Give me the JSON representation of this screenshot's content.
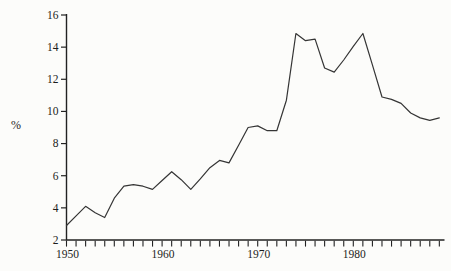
{
  "page": {
    "background": "#fcfcfa"
  },
  "chart_data": {
    "type": "line",
    "title": "",
    "xlabel": "",
    "ylabel": "%",
    "x_range": [
      1950,
      1989
    ],
    "ylim": [
      2,
      16
    ],
    "y_ticks": [
      2,
      4,
      6,
      8,
      10,
      12,
      14,
      16
    ],
    "x_tick_interval": 1,
    "labeled_x_ticks": [
      1950,
      1960,
      1970,
      1980
    ],
    "grid": false,
    "legend": "none",
    "series": [
      {
        "name": "percent",
        "x": [
          1950,
          1951,
          1952,
          1953,
          1954,
          1955,
          1956,
          1957,
          1958,
          1959,
          1960,
          1961,
          1962,
          1963,
          1964,
          1965,
          1966,
          1967,
          1968,
          1969,
          1970,
          1971,
          1972,
          1973,
          1974,
          1975,
          1976,
          1977,
          1978,
          1979,
          1980,
          1981,
          1982,
          1983,
          1984,
          1985,
          1986,
          1987,
          1988,
          1989
        ],
        "values": [
          2.9,
          3.5,
          4.1,
          3.7,
          3.4,
          4.6,
          5.35,
          5.45,
          5.35,
          5.15,
          5.7,
          6.25,
          5.75,
          5.15,
          5.8,
          6.5,
          6.95,
          6.8,
          7.9,
          9.0,
          9.1,
          8.8,
          8.8,
          10.7,
          14.85,
          14.4,
          14.5,
          12.7,
          12.45,
          13.2,
          14.05,
          14.85,
          12.9,
          10.9,
          10.75,
          10.5,
          9.9,
          9.6,
          9.45,
          9.6
        ]
      }
    ],
    "style": {
      "line_color": "#353535",
      "axis_color": "#222222",
      "text_color": "#1c1c1c"
    }
  }
}
